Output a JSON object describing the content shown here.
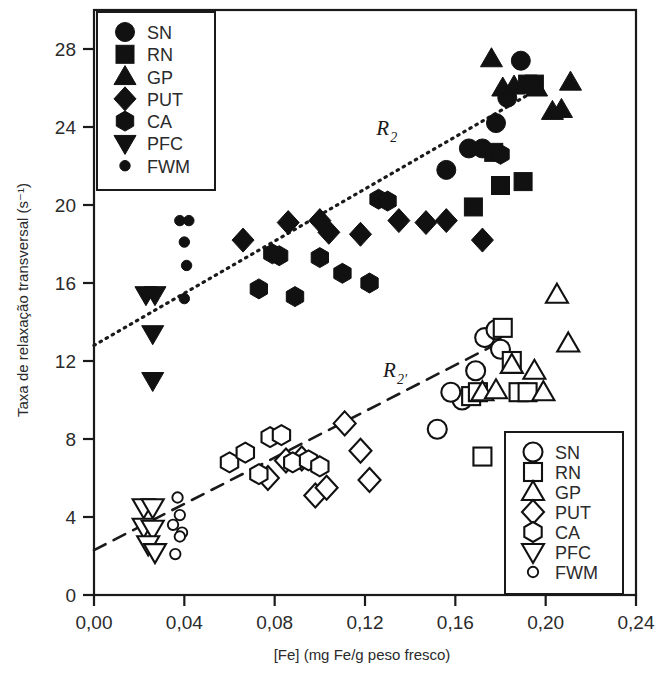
{
  "chart_data": {
    "type": "scatter",
    "title": "",
    "xlabel": "[Fe] (mg Fe/g peso fresco)",
    "ylabel": "Taxa de relaxação transversal (s⁻¹)",
    "xlim": [
      0.0,
      0.24
    ],
    "ylim": [
      0,
      30
    ],
    "xticks": [
      "0,00",
      "0,04",
      "0,08",
      "0,12",
      "0,16",
      "0,20",
      "0,24"
    ],
    "xtick_values": [
      0.0,
      0.04,
      0.08,
      0.12,
      0.16,
      0.2,
      0.24
    ],
    "yticks": [
      "0",
      "4",
      "8",
      "12",
      "16",
      "20",
      "24",
      "28"
    ],
    "ytick_values": [
      0,
      4,
      8,
      12,
      16,
      20,
      24,
      28
    ],
    "grid": false,
    "marker_color": "#111111",
    "annotations": [
      {
        "text": "R",
        "sub": "2",
        "x": 0.125,
        "y": 23.6,
        "name": "r2-line-label"
      },
      {
        "text": "R",
        "sub": "2'",
        "x": 0.128,
        "y": 11.2,
        "name": "r2prime-line-label"
      }
    ],
    "fit_lines": [
      {
        "name": "R2",
        "style": "dotted",
        "x0": 0.0,
        "y0": 12.8,
        "x1": 0.196,
        "y1": 25.9
      },
      {
        "name": "R2'",
        "style": "dashed",
        "x0": 0.0,
        "y0": 2.3,
        "x1": 0.177,
        "y1": 12.8
      }
    ],
    "series": [
      {
        "name": "SN",
        "marker": "circle",
        "fill": "filled",
        "group": "R2",
        "points": [
          [
            0.156,
            21.8
          ],
          [
            0.166,
            22.9
          ],
          [
            0.172,
            22.9
          ],
          [
            0.178,
            24.2
          ],
          [
            0.183,
            25.5
          ],
          [
            0.189,
            27.4
          ]
        ]
      },
      {
        "name": "RN",
        "marker": "square",
        "fill": "filled",
        "group": "R2",
        "points": [
          [
            0.168,
            19.9
          ],
          [
            0.177,
            22.7
          ],
          [
            0.18,
            21.0
          ],
          [
            0.19,
            21.2
          ],
          [
            0.192,
            26.2
          ],
          [
            0.195,
            26.2
          ]
        ]
      },
      {
        "name": "GP",
        "marker": "triangle-up",
        "fill": "filled",
        "group": "R2",
        "points": [
          [
            0.176,
            27.5
          ],
          [
            0.181,
            26.0
          ],
          [
            0.186,
            26.1
          ],
          [
            0.196,
            26.0
          ],
          [
            0.203,
            24.8
          ],
          [
            0.207,
            24.9
          ],
          [
            0.211,
            26.3
          ]
        ]
      },
      {
        "name": "PUT",
        "marker": "diamond",
        "fill": "filled",
        "group": "R2",
        "points": [
          [
            0.066,
            18.2
          ],
          [
            0.086,
            19.1
          ],
          [
            0.1,
            19.2
          ],
          [
            0.104,
            18.6
          ],
          [
            0.118,
            18.5
          ],
          [
            0.135,
            19.2
          ],
          [
            0.147,
            19.1
          ],
          [
            0.156,
            19.2
          ],
          [
            0.172,
            18.2
          ]
        ]
      },
      {
        "name": "CA",
        "marker": "hexagon",
        "fill": "filled",
        "group": "R2",
        "points": [
          [
            0.073,
            15.7
          ],
          [
            0.079,
            17.5
          ],
          [
            0.082,
            17.4
          ],
          [
            0.089,
            15.3
          ],
          [
            0.1,
            17.3
          ],
          [
            0.11,
            16.5
          ],
          [
            0.122,
            16.0
          ],
          [
            0.126,
            20.3
          ],
          [
            0.13,
            20.2
          ],
          [
            0.18,
            22.6
          ]
        ]
      },
      {
        "name": "PFC",
        "marker": "triangle-down",
        "fill": "filled",
        "group": "R2",
        "points": [
          [
            0.023,
            15.4
          ],
          [
            0.027,
            15.4
          ],
          [
            0.026,
            13.4
          ],
          [
            0.026,
            11.0
          ]
        ]
      },
      {
        "name": "FWM",
        "marker": "dot",
        "fill": "filled",
        "group": "R2",
        "points": [
          [
            0.038,
            19.2
          ],
          [
            0.042,
            19.2
          ],
          [
            0.04,
            18.1
          ],
          [
            0.041,
            16.9
          ],
          [
            0.04,
            15.2
          ]
        ]
      },
      {
        "name": "SN",
        "marker": "circle",
        "fill": "open",
        "group": "R2'",
        "points": [
          [
            0.152,
            8.5
          ],
          [
            0.163,
            10.0
          ],
          [
            0.169,
            11.5
          ],
          [
            0.173,
            13.2
          ],
          [
            0.178,
            13.6
          ],
          [
            0.18,
            12.6
          ],
          [
            0.158,
            10.4
          ]
        ]
      },
      {
        "name": "RN",
        "marker": "square",
        "fill": "open",
        "group": "R2'",
        "points": [
          [
            0.167,
            10.2
          ],
          [
            0.17,
            10.4
          ],
          [
            0.172,
            7.1
          ],
          [
            0.181,
            13.7
          ],
          [
            0.185,
            12.0
          ],
          [
            0.188,
            10.4
          ],
          [
            0.192,
            10.4
          ]
        ]
      },
      {
        "name": "GP",
        "marker": "triangle-up",
        "fill": "open",
        "group": "R2'",
        "points": [
          [
            0.172,
            10.4
          ],
          [
            0.178,
            10.5
          ],
          [
            0.185,
            11.8
          ],
          [
            0.195,
            11.5
          ],
          [
            0.199,
            10.4
          ],
          [
            0.205,
            15.4
          ],
          [
            0.21,
            12.9
          ]
        ]
      },
      {
        "name": "PUT",
        "marker": "diamond",
        "fill": "open",
        "group": "R2'",
        "points": [
          [
            0.077,
            6.0
          ],
          [
            0.085,
            6.9
          ],
          [
            0.092,
            7.0
          ],
          [
            0.098,
            5.1
          ],
          [
            0.103,
            5.5
          ],
          [
            0.111,
            8.8
          ],
          [
            0.118,
            7.4
          ],
          [
            0.122,
            5.9
          ]
        ]
      },
      {
        "name": "CA",
        "marker": "hexagon",
        "fill": "open",
        "group": "R2'",
        "points": [
          [
            0.06,
            6.8
          ],
          [
            0.067,
            7.3
          ],
          [
            0.073,
            6.2
          ],
          [
            0.078,
            8.1
          ],
          [
            0.083,
            8.2
          ],
          [
            0.088,
            6.8
          ],
          [
            0.095,
            6.9
          ],
          [
            0.1,
            6.6
          ]
        ]
      },
      {
        "name": "PFC",
        "marker": "triangle-down",
        "fill": "open",
        "group": "R2'",
        "points": [
          [
            0.022,
            4.5
          ],
          [
            0.026,
            4.5
          ],
          [
            0.022,
            3.5
          ],
          [
            0.026,
            3.4
          ],
          [
            0.024,
            2.6
          ],
          [
            0.027,
            2.2
          ]
        ]
      },
      {
        "name": "FWM",
        "marker": "dot",
        "fill": "open",
        "group": "R2'",
        "points": [
          [
            0.037,
            5.0
          ],
          [
            0.038,
            4.1
          ],
          [
            0.035,
            3.6
          ],
          [
            0.039,
            3.2
          ],
          [
            0.038,
            3.0
          ],
          [
            0.036,
            2.1
          ]
        ]
      }
    ]
  },
  "legend_filled": {
    "name": "legend-filled",
    "entries": [
      {
        "label": "SN",
        "marker": "circle"
      },
      {
        "label": "RN",
        "marker": "square"
      },
      {
        "label": "GP",
        "marker": "triangle-up"
      },
      {
        "label": "PUT",
        "marker": "diamond"
      },
      {
        "label": "CA",
        "marker": "hexagon"
      },
      {
        "label": "PFC",
        "marker": "triangle-down"
      },
      {
        "label": "FWM",
        "marker": "dot"
      }
    ]
  },
  "legend_open": {
    "name": "legend-open",
    "entries": [
      {
        "label": "SN",
        "marker": "circle"
      },
      {
        "label": "RN",
        "marker": "square"
      },
      {
        "label": "GP",
        "marker": "triangle-up"
      },
      {
        "label": "PUT",
        "marker": "diamond"
      },
      {
        "label": "CA",
        "marker": "hexagon"
      },
      {
        "label": "PFC",
        "marker": "triangle-down"
      },
      {
        "label": "FWM",
        "marker": "dot"
      }
    ]
  }
}
